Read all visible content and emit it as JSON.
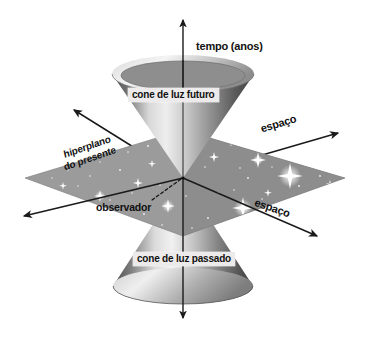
{
  "figure": {
    "title_text": "",
    "language": "pt-BR",
    "background_color": "#ffffff"
  },
  "axes": {
    "time": {
      "label": "tempo (anos)",
      "direction": "vertical",
      "arrow_up": true,
      "arrow_down": true
    },
    "space_upper_right": {
      "label": "espaço",
      "arrow": true
    },
    "space_lower_right": {
      "label": "espaço",
      "arrow": true
    },
    "space_upper_left": {
      "label": "",
      "arrow": true
    },
    "space_lower_left": {
      "label": "",
      "arrow": true
    }
  },
  "cones": {
    "future": {
      "label": "cone de luz futuro",
      "position": "above-plane"
    },
    "past": {
      "label": "cone de luz passado",
      "position": "below-plane"
    }
  },
  "plane": {
    "label_line1": "hiperplano",
    "label_line2": "do presente",
    "fill_left": "#9a9a9a",
    "fill_right": "#8a8a8a"
  },
  "annotations": {
    "observer": {
      "label": "observador",
      "leader": "dashed"
    }
  },
  "colors": {
    "ink": "#111111",
    "label_box": "#eceaea",
    "cone_light": "#e9e9e9",
    "cone_dark": "#4a4a4a",
    "star": "#ffffff"
  }
}
